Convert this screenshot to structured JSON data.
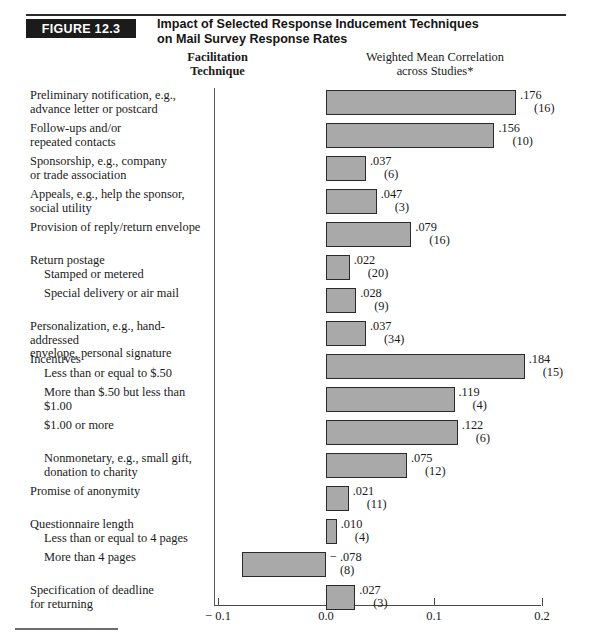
{
  "header": {
    "figure_badge": "FIGURE 12.3",
    "title_line1": "Impact of Selected Response Inducement Techniques",
    "title_line2": "on Mail Survey Response Rates"
  },
  "columns": {
    "left_line1": "Facilitation",
    "left_line2": "Technique",
    "right_line1": "Weighted Mean Correlation",
    "right_line2": "across Studies*"
  },
  "axis": {
    "ticks": [
      "− 0.1",
      "0.0",
      "0.1",
      "0.2"
    ],
    "tick_values": [
      -0.1,
      0.0,
      0.1,
      0.2
    ],
    "min": -0.1,
    "max": 0.2
  },
  "chart_data": {
    "type": "bar",
    "orientation": "horizontal",
    "title": "Impact of Selected Response Inducement Techniques on Mail Survey Response Rates",
    "xlabel": "Weighted Mean Correlation across Studies*",
    "ylabel": "Facilitation Technique",
    "xlim": [
      -0.1,
      0.2
    ],
    "grid": false,
    "legend": "none",
    "value_labels": true,
    "bar_color": "#a9a9a9",
    "bar_border_color": "#2a2a2a",
    "categories": [
      "Preliminary notification, e.g., advance letter or postcard",
      "Follow-ups and/or repeated contacts",
      "Sponsorship, e.g., company or trade association",
      "Appeals, e.g., help the sponsor, social utility",
      "Provision of reply/return envelope",
      "Return postage — Stamped or metered",
      "Return postage — Special delivery or air mail",
      "Personalization, e.g., hand-addressed envelope, personal signature",
      "Incentives — Less than or equal to $.50",
      "Incentives — More than $.50 but less than $1.00",
      "Incentives — $1.00 or more",
      "Incentives — Nonmonetary, e.g., small gift, donation to charity",
      "Promise of anonymity",
      "Questionnaire length — Less than or equal to 4 pages",
      "Questionnaire length — More than 4 pages",
      "Specification of deadline for returning"
    ],
    "values": [
      0.176,
      0.156,
      0.037,
      0.047,
      0.079,
      0.022,
      0.028,
      0.037,
      0.184,
      0.119,
      0.122,
      0.075,
      0.021,
      0.01,
      -0.078,
      0.027
    ],
    "study_counts": [
      16,
      10,
      6,
      3,
      16,
      20,
      9,
      34,
      15,
      4,
      6,
      12,
      11,
      4,
      8,
      3
    ]
  },
  "rows": [
    {
      "label_lines": [
        "Preliminary notification, e.g.,",
        "advance letter or postcard"
      ],
      "indent": false,
      "value_label": ".176",
      "count_label": "(16)",
      "value": 0.176
    },
    {
      "label_lines": [
        "Follow-ups and/or",
        "repeated contacts"
      ],
      "indent": false,
      "value_label": ".156",
      "count_label": "(10)",
      "value": 0.156
    },
    {
      "label_lines": [
        "Sponsorship, e.g., company",
        "or trade association"
      ],
      "indent": false,
      "value_label": ".037",
      "count_label": "(6)",
      "value": 0.037
    },
    {
      "label_lines": [
        "Appeals, e.g., help the sponsor,",
        "social utility"
      ],
      "indent": false,
      "value_label": ".047",
      "count_label": "(3)",
      "value": 0.047
    },
    {
      "label_lines": [
        "Provision of reply/return envelope"
      ],
      "indent": false,
      "value_label": ".079",
      "count_label": "(16)",
      "value": 0.079
    },
    {
      "label_lines": [
        "Return postage",
        "Stamped or metered"
      ],
      "indent": false,
      "sub_second_line": true,
      "value_label": ".022",
      "count_label": "(20)",
      "value": 0.022
    },
    {
      "label_lines": [
        "Special delivery or air mail"
      ],
      "indent": true,
      "value_label": ".028",
      "count_label": "(9)",
      "value": 0.028
    },
    {
      "label_lines": [
        "Personalization, e.g., hand-addressed",
        "envelope, personal signature"
      ],
      "indent": false,
      "value_label": ".037",
      "count_label": "(34)",
      "value": 0.037
    },
    {
      "label_lines": [
        "Incentives",
        "Less than or equal to $.50"
      ],
      "indent": false,
      "sub_second_line": true,
      "value_label": ".184",
      "count_label": "(15)",
      "value": 0.184
    },
    {
      "label_lines": [
        "More than $.50 but less than $1.00"
      ],
      "indent": true,
      "value_label": ".119",
      "count_label": "(4)",
      "value": 0.119
    },
    {
      "label_lines": [
        "$1.00 or more"
      ],
      "indent": true,
      "value_label": ".122",
      "count_label": "(6)",
      "value": 0.122
    },
    {
      "label_lines": [
        "Nonmonetary, e.g., small gift,",
        "donation to charity"
      ],
      "indent": true,
      "value_label": ".075",
      "count_label": "(12)",
      "value": 0.075
    },
    {
      "label_lines": [
        "Promise of anonymity"
      ],
      "indent": false,
      "value_label": ".021",
      "count_label": "(11)",
      "value": 0.021
    },
    {
      "label_lines": [
        "Questionnaire length",
        "Less than or equal to 4 pages"
      ],
      "indent": false,
      "sub_second_line": true,
      "value_label": ".010",
      "count_label": "(4)",
      "value": 0.01
    },
    {
      "label_lines": [
        "More than 4 pages"
      ],
      "indent": true,
      "value_label": "− .078",
      "count_label": "(8)",
      "value": -0.078
    },
    {
      "label_lines": [
        "Specification of deadline",
        "for returning"
      ],
      "indent": false,
      "value_label": ".027",
      "count_label": "(3)",
      "value": 0.027
    }
  ]
}
